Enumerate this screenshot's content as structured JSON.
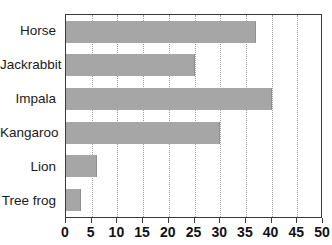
{
  "chart_data": {
    "type": "bar",
    "orientation": "horizontal",
    "title": "",
    "subtitle": "",
    "xlabel": "",
    "ylabel": "",
    "categories": [
      "Horse",
      "Jackrabbit",
      "Impala",
      "Kangaroo",
      "Lion",
      "Tree frog"
    ],
    "values": [
      37,
      25,
      40,
      30,
      6,
      3
    ],
    "xlim": [
      0,
      50
    ],
    "xticks": [
      0,
      5,
      10,
      15,
      20,
      25,
      30,
      35,
      40,
      45,
      50
    ],
    "xtick_labels": [
      "0",
      "5",
      "10",
      "15",
      "20",
      "25",
      "30",
      "35",
      "40",
      "45",
      "50"
    ],
    "grid": true,
    "grid_axis": "x",
    "grid_style": "dotted",
    "legend": false,
    "legend_position": "none",
    "bar_color": "#a6a6a6",
    "axis_color": "#3a3a3a",
    "gridline_color": "#9a9a9a",
    "background_color": "#ffffff",
    "annotations": []
  }
}
